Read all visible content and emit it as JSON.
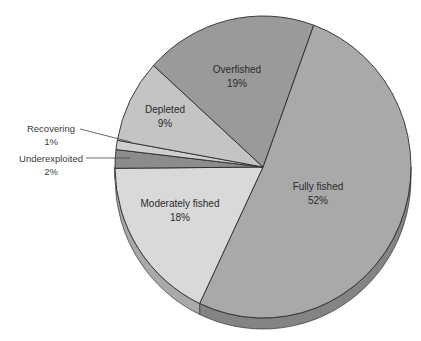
{
  "chart_data": {
    "type": "pie",
    "title": "",
    "style": "3d-tilted",
    "categories": [
      "Fully fished",
      "Moderately fished",
      "Underexploited",
      "Recovering",
      "Depleted",
      "Overfished"
    ],
    "values": [
      52,
      18,
      2,
      1,
      9,
      19
    ],
    "unit": "%",
    "slices": [
      {
        "label": "Fully fished",
        "value": 52,
        "value_label": "52%",
        "color": "#a9a9a9"
      },
      {
        "label": "Moderately fished",
        "value": 18,
        "value_label": "18%",
        "color": "#d9d9d9"
      },
      {
        "label": "Underexploited",
        "value": 2,
        "value_label": "2%",
        "color": "#8c8c8c",
        "leader_line": true
      },
      {
        "label": "Recovering",
        "value": 1,
        "value_label": "1%",
        "color": "#cfcfcf",
        "leader_line": true
      },
      {
        "label": "Depleted",
        "value": 9,
        "value_label": "9%",
        "color": "#c4c4c4"
      },
      {
        "label": "Overfished",
        "value": 19,
        "value_label": "19%",
        "color": "#9a9a9a"
      }
    ],
    "legend": "none (labels inside slices / leader lines)",
    "start_angle_deg": -70
  }
}
